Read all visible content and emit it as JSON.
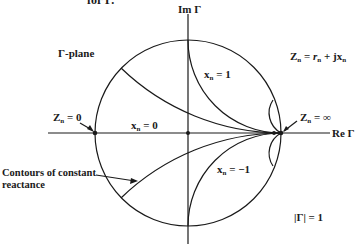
{
  "figure": {
    "caption_fragment": "for Γ.",
    "plane_label": "Γ-plane",
    "axes": {
      "imag_label": "Im Γ",
      "real_label": "Re Γ"
    },
    "impedance_def": {
      "lhs": "Z",
      "lhs_sub": "n",
      "eq": " = ",
      "r": "r",
      "r_sub": "n",
      "plus": " + j",
      "x": "x",
      "x_sub": "n"
    },
    "point_labels": {
      "short": {
        "main": "Z",
        "sub": "n",
        "rest": " = 0"
      },
      "open": {
        "main": "Z",
        "sub": "n",
        "rest": " = ∞"
      }
    },
    "reactance_labels": {
      "x_pos1": {
        "main": "x",
        "sub": "n",
        "rest": " = 1"
      },
      "x_zero": {
        "main": "x",
        "sub": "n",
        "rest": " = 0"
      },
      "x_neg1": {
        "main": "x",
        "sub": "n",
        "rest": " = −1"
      }
    },
    "annotation": {
      "line1": "Contours of constant",
      "line2": "reactance"
    },
    "unit_circle_label": "|Γ| = 1",
    "geometry": {
      "center_px": [
        188,
        133
      ],
      "radius_px": 93,
      "reactance_values_drawn": [
        0.4,
        1,
        4,
        0,
        -0.4,
        -1,
        -4
      ]
    },
    "colors": {
      "ink": "#1a1a1a",
      "background": "#ffffff"
    }
  }
}
